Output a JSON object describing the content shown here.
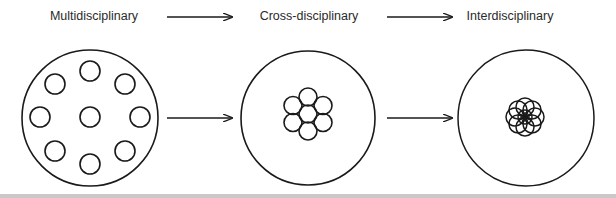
{
  "diagram": {
    "stages": [
      {
        "label": "Multidisciplinary",
        "description": "separate small circles spread apart inside large circle"
      },
      {
        "label": "Cross-disciplinary",
        "description": "small circles clustered and touching (hexagonal packing)"
      },
      {
        "label": "Interdisciplinary",
        "description": "small circles overlapping in a rosette"
      }
    ],
    "arrows": [
      {
        "from": "Multidisciplinary",
        "to": "Cross-disciplinary"
      },
      {
        "from": "Cross-disciplinary",
        "to": "Interdisciplinary"
      }
    ],
    "colors": {
      "stroke": "#1a1a1a",
      "text": "#2a2a2a",
      "background": "#ffffff"
    }
  }
}
